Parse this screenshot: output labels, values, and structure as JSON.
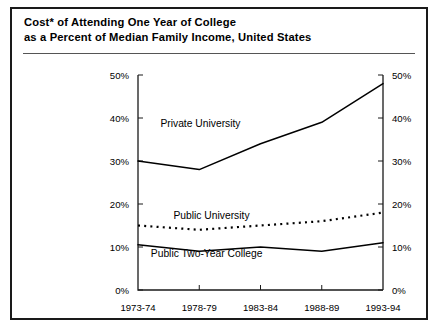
{
  "figure": {
    "title_line_1": "Cost* of Attending One Year of College",
    "title_line_2": "as a Percent of Median Family Income, United States"
  },
  "chart_data": {
    "type": "line",
    "title": "Cost* of Attending One Year of College as a Percent of Median Family Income, United States",
    "xlabel": "",
    "ylabel": "",
    "ylim": [
      0,
      50
    ],
    "yticks": [
      0,
      10,
      20,
      30,
      40,
      50
    ],
    "ytick_labels": [
      "0%",
      "10%",
      "20%",
      "30%",
      "40%",
      "50%"
    ],
    "right_axis": true,
    "right_ytick_labels": [
      "0%",
      "10%",
      "20%",
      "30%",
      "40%",
      "50%"
    ],
    "grid": false,
    "legend": "inline-labels",
    "categories": [
      "1973-74",
      "1978-79",
      "1983-84",
      "1988-89",
      "1993-94"
    ],
    "series": [
      {
        "name": "Private University",
        "style": "solid",
        "color": "#000000",
        "values": [
          30,
          28,
          34,
          39,
          48
        ]
      },
      {
        "name": "Public University",
        "style": "dotted",
        "color": "#000000",
        "values": [
          15,
          14,
          15,
          16,
          18
        ]
      },
      {
        "name": "Public Two-Year College",
        "style": "solid",
        "color": "#000000",
        "values": [
          10.5,
          9,
          10,
          9,
          11
        ]
      }
    ],
    "annotations": [
      {
        "text": "Private University",
        "x_frac": 0.255,
        "y_value": 38.0
      },
      {
        "text": "Public University",
        "x_frac": 0.3,
        "y_value": 16.6
      },
      {
        "text": "Public Two-Year College",
        "x_frac": 0.28,
        "y_value": 7.6
      }
    ]
  }
}
